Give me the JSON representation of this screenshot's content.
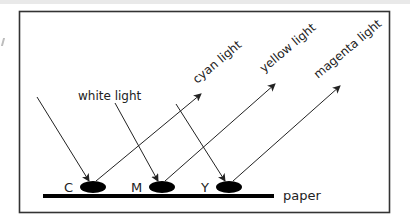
{
  "diagram": {
    "labels": {
      "white_light": "white light",
      "cyan_light": "cyan light",
      "yellow_light": "yellow light",
      "magenta_light": "magenta light",
      "paper": "paper"
    },
    "inks": [
      {
        "letter": "C",
        "name": "cyan"
      },
      {
        "letter": "M",
        "name": "magenta"
      },
      {
        "letter": "Y",
        "name": "yellow"
      }
    ],
    "colors": {
      "line": "#222222",
      "frame": "#333333",
      "ink": "#000000",
      "background": "#ffffff"
    }
  }
}
